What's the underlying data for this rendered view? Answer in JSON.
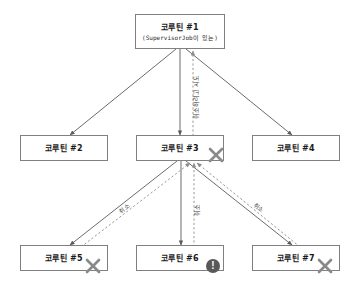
{
  "diagram": {
    "type": "coroutine-supervisor-job-cancellation-tree",
    "colors": {
      "background": "#ffffff",
      "node_border": "#808080",
      "edge_solid": "#5a5a5a",
      "edge_dashed": "#8c8c8c",
      "badge_x": "#8a8a8a",
      "badge_alert": "#595959",
      "text": "#1a1a1a"
    },
    "nodes": [
      {
        "id": "n1",
        "title": "코루틴 #1",
        "subtitle": "(SupervisorJob이 있는)",
        "level": 0,
        "badge": "none"
      },
      {
        "id": "n2",
        "title": "코루틴 #2",
        "subtitle": "",
        "level": 1,
        "badge": "none"
      },
      {
        "id": "n3",
        "title": "코루틴 #3",
        "subtitle": "",
        "level": 1,
        "badge": "x"
      },
      {
        "id": "n4",
        "title": "코루틴 #4",
        "subtitle": "",
        "level": 1,
        "badge": "none"
      },
      {
        "id": "n5",
        "title": "코루틴 #5",
        "subtitle": "",
        "level": 2,
        "badge": "x"
      },
      {
        "id": "n6",
        "title": "코루틴 #6",
        "subtitle": "",
        "level": 2,
        "badge": "alert"
      },
      {
        "id": "n7",
        "title": "코루틴 #7",
        "subtitle": "",
        "level": 2,
        "badge": "none"
      },
      {
        "id": "n7b",
        "title": "",
        "subtitle": "",
        "level": 2,
        "badge": "x"
      }
    ],
    "edges": [
      {
        "from": "n1",
        "to": "n2",
        "style": "solid",
        "direction": "down",
        "label": ""
      },
      {
        "from": "n1",
        "to": "n3",
        "style": "solid",
        "direction": "down",
        "label": ""
      },
      {
        "from": "n1",
        "to": "n4",
        "style": "solid",
        "direction": "down",
        "label": ""
      },
      {
        "from": "n3",
        "to": "n1",
        "style": "dashed",
        "direction": "up",
        "label": "취소하려고 시도"
      },
      {
        "from": "n3",
        "to": "n5",
        "style": "solid",
        "direction": "down",
        "label": ""
      },
      {
        "from": "n3",
        "to": "n6",
        "style": "solid",
        "direction": "down",
        "label": ""
      },
      {
        "from": "n3",
        "to": "n7",
        "style": "solid",
        "direction": "down",
        "label": ""
      },
      {
        "from": "n5",
        "to": "n3",
        "style": "dashed",
        "direction": "up",
        "label": "취소"
      },
      {
        "from": "n6",
        "to": "n3",
        "style": "dashed",
        "direction": "up",
        "label": "취소"
      },
      {
        "from": "n7",
        "to": "n3",
        "style": "dashed",
        "direction": "up",
        "label": "취소"
      }
    ],
    "labels": {
      "attempt_cancel": "취소하려고 시도",
      "cancel_left": "취소",
      "cancel_center": "취소",
      "cancel_right": "취소"
    },
    "badges": {
      "x_icon_name": "cancel-x-icon",
      "alert_icon_name": "alert-exclamation-icon",
      "alert_glyph": "!"
    }
  }
}
